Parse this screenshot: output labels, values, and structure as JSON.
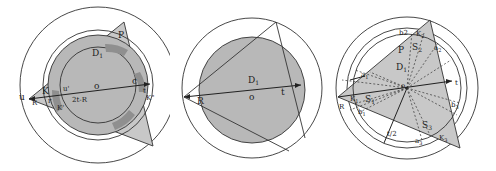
{
  "colors": {
    "line": "#333333",
    "fill_light": "#c8c8c8",
    "fill_mid": "#b3b3b3",
    "fill_dark": "#8f8f8f",
    "background": "#ffffff"
  },
  "panels": [
    {
      "id": "panel-1",
      "labels": {
        "P": "P",
        "D1": "D",
        "D1_sub": "1",
        "K": "K",
        "u": "u",
        "u_prime": "u'",
        "o": "o",
        "c": "c",
        "t": "t",
        "K_dprime": "K\"",
        "K_prime": "K'",
        "two_t_minus_R": "2t-R",
        "R": "R",
        "r": "r"
      }
    },
    {
      "id": "panel-2",
      "labels": {
        "D1": "D",
        "D1_sub": "1",
        "o": "o",
        "t": "t",
        "R": "R"
      }
    },
    {
      "id": "panel-3",
      "labels": {
        "P": "P",
        "D1": "D",
        "D1_sub": "1",
        "b2": "b2",
        "K2": "K",
        "K2_sub": "2",
        "S2": "S",
        "S2_sub": "2",
        "a2": "a",
        "a2_sub": "2",
        "a1": "a",
        "a1_sub": "1",
        "K1": "K",
        "K1_sub": "1",
        "S1": "S",
        "S1_sub": "1",
        "R": "R",
        "b1": "b",
        "b1_sub": "1",
        "t": "t",
        "o": "o",
        "b3": "b",
        "b3_sub": "3",
        "S3": "S",
        "S3_sub": "3",
        "a3": "a",
        "a3_sub": "3",
        "K3": "K",
        "K3_sub": "3",
        "t_half": "t/2"
      }
    }
  ]
}
